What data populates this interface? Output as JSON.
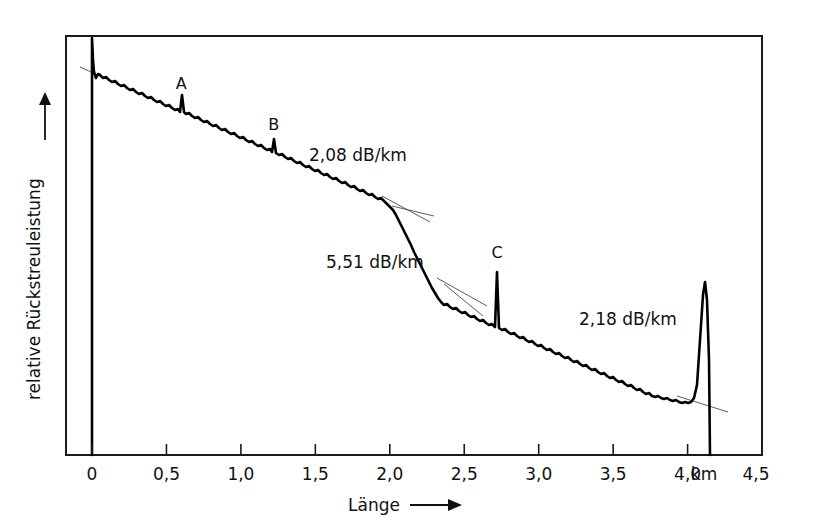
{
  "figure": {
    "kind": "otdr-backscatter-trace",
    "background": "#ffffff",
    "ink_color": "#000000",
    "tangent_color": "#4a4a4a"
  },
  "axes": {
    "x": {
      "label": "Länge",
      "unit_label": "km",
      "arrow": "right-arrow-icon",
      "ticks": [
        "0",
        "0,5",
        "1,0",
        "1,5",
        "2,0",
        "2,5",
        "3,0",
        "3,5",
        "4,0",
        "4,5"
      ],
      "tick_values": [
        0,
        0.5,
        1.0,
        1.5,
        2.0,
        2.5,
        3.0,
        3.5,
        4.0,
        4.5
      ],
      "min": 0,
      "max": 4.5
    },
    "y": {
      "label": "relative Rückstreuleistung",
      "arrow": "up-arrow-icon",
      "ticks": []
    }
  },
  "annotations": {
    "event_labels": [
      {
        "text": "A",
        "x_km": 0.6
      },
      {
        "text": "B",
        "x_km": 1.22
      },
      {
        "text": "C",
        "x_km": 2.72
      }
    ],
    "attenuation_labels": [
      {
        "text": "2,08 dB/km",
        "x_km": 1.48,
        "segment": 1
      },
      {
        "text": "5,51 dB/km",
        "x_km": 1.57,
        "segment": 2
      },
      {
        "text": "2,18 dB/km",
        "x_km": 3.3,
        "segment": 3
      }
    ]
  },
  "chart_data": {
    "type": "line",
    "title": "",
    "xlabel": "Länge",
    "ylabel": "relative Rückstreuleistung",
    "xlim": [
      0,
      4.5
    ],
    "ylim": [
      0,
      1
    ],
    "grid": false,
    "legend": null,
    "xticks": [
      0,
      0.5,
      1.0,
      1.5,
      2.0,
      2.5,
      3.0,
      3.5,
      4.0,
      4.5
    ],
    "xticklabels": [
      "0",
      "0,5",
      "1,0",
      "1,5",
      "2,0",
      "2,5",
      "3,0",
      "3,5",
      "4,0",
      "4,5"
    ],
    "x_unit": "km",
    "yticklabels": [],
    "series": [
      {
        "name": "backscatter",
        "comment": "Pixel polyline in screenshot coordinates; x px = 92 + km*148.9",
        "points_px": [
          [
            92,
            455
          ],
          [
            92,
            150
          ],
          [
            92,
            38
          ],
          [
            93,
            60
          ],
          [
            94,
            72
          ],
          [
            96,
            78
          ],
          [
            98,
            74
          ],
          [
            100,
            75
          ],
          [
            103,
            78
          ],
          [
            106,
            77
          ],
          [
            109,
            80
          ],
          [
            112,
            82
          ],
          [
            115,
            81
          ],
          [
            118,
            84
          ],
          [
            121,
            86
          ],
          [
            124,
            85
          ],
          [
            127,
            88
          ],
          [
            130,
            90
          ],
          [
            133,
            89
          ],
          [
            136,
            92
          ],
          [
            139,
            94
          ],
          [
            142,
            93
          ],
          [
            145,
            96
          ],
          [
            148,
            98
          ],
          [
            151,
            97
          ],
          [
            154,
            100
          ],
          [
            157,
            102
          ],
          [
            160,
            101
          ],
          [
            163,
            104
          ],
          [
            166,
            106
          ],
          [
            169,
            105
          ],
          [
            172,
            108
          ],
          [
            175,
            110
          ],
          [
            178,
            109
          ],
          [
            180,
            112
          ],
          [
            182,
            95
          ],
          [
            184,
            112
          ],
          [
            186,
            114
          ],
          [
            189,
            113
          ],
          [
            192,
            116
          ],
          [
            195,
            118
          ],
          [
            198,
            117
          ],
          [
            201,
            120
          ],
          [
            204,
            122
          ],
          [
            207,
            121
          ],
          [
            210,
            124
          ],
          [
            213,
            126
          ],
          [
            216,
            125
          ],
          [
            219,
            128
          ],
          [
            222,
            130
          ],
          [
            225,
            129
          ],
          [
            228,
            132
          ],
          [
            231,
            134
          ],
          [
            234,
            133
          ],
          [
            237,
            136
          ],
          [
            240,
            138
          ],
          [
            243,
            137
          ],
          [
            246,
            140
          ],
          [
            249,
            142
          ],
          [
            252,
            141
          ],
          [
            255,
            144
          ],
          [
            258,
            146
          ],
          [
            261,
            145
          ],
          [
            264,
            148
          ],
          [
            267,
            150
          ],
          [
            270,
            149
          ],
          [
            272,
            152
          ],
          [
            274,
            139
          ],
          [
            276,
            153
          ],
          [
            279,
            155
          ],
          [
            282,
            154
          ],
          [
            285,
            157
          ],
          [
            288,
            159
          ],
          [
            291,
            158
          ],
          [
            294,
            161
          ],
          [
            297,
            163
          ],
          [
            300,
            162
          ],
          [
            303,
            165
          ],
          [
            306,
            167
          ],
          [
            309,
            166
          ],
          [
            312,
            169
          ],
          [
            315,
            171
          ],
          [
            318,
            170
          ],
          [
            321,
            173
          ],
          [
            324,
            175
          ],
          [
            327,
            174
          ],
          [
            330,
            177
          ],
          [
            333,
            179
          ],
          [
            336,
            178
          ],
          [
            339,
            181
          ],
          [
            342,
            183
          ],
          [
            345,
            182
          ],
          [
            348,
            185
          ],
          [
            351,
            187
          ],
          [
            354,
            186
          ],
          [
            357,
            189
          ],
          [
            360,
            191
          ],
          [
            363,
            190
          ],
          [
            366,
            193
          ],
          [
            369,
            195
          ],
          [
            372,
            194
          ],
          [
            375,
            197
          ],
          [
            378,
            199
          ],
          [
            381,
            198
          ],
          [
            384,
            201
          ],
          [
            387,
            204
          ],
          [
            390,
            207
          ],
          [
            393,
            210
          ],
          [
            396,
            215
          ],
          [
            399,
            221
          ],
          [
            402,
            227
          ],
          [
            405,
            233
          ],
          [
            408,
            239
          ],
          [
            411,
            245
          ],
          [
            414,
            252
          ],
          [
            417,
            258
          ],
          [
            420,
            264
          ],
          [
            423,
            270
          ],
          [
            426,
            276
          ],
          [
            429,
            282
          ],
          [
            432,
            288
          ],
          [
            435,
            293
          ],
          [
            438,
            298
          ],
          [
            441,
            302
          ],
          [
            444,
            305
          ],
          [
            447,
            304
          ],
          [
            450,
            307
          ],
          [
            453,
            309
          ],
          [
            456,
            308
          ],
          [
            459,
            311
          ],
          [
            462,
            313
          ],
          [
            465,
            312
          ],
          [
            468,
            315
          ],
          [
            471,
            317
          ],
          [
            474,
            316
          ],
          [
            477,
            319
          ],
          [
            480,
            321
          ],
          [
            483,
            320
          ],
          [
            486,
            323
          ],
          [
            489,
            325
          ],
          [
            492,
            324
          ],
          [
            495,
            327
          ],
          [
            497,
            272
          ],
          [
            499,
            328
          ],
          [
            502,
            330
          ],
          [
            505,
            329
          ],
          [
            508,
            332
          ],
          [
            511,
            334
          ],
          [
            514,
            333
          ],
          [
            517,
            336
          ],
          [
            520,
            338
          ],
          [
            523,
            337
          ],
          [
            526,
            340
          ],
          [
            529,
            342
          ],
          [
            532,
            341
          ],
          [
            535,
            344
          ],
          [
            538,
            346
          ],
          [
            541,
            345
          ],
          [
            544,
            348
          ],
          [
            547,
            350
          ],
          [
            550,
            349
          ],
          [
            553,
            352
          ],
          [
            556,
            354
          ],
          [
            559,
            353
          ],
          [
            562,
            356
          ],
          [
            565,
            358
          ],
          [
            568,
            357
          ],
          [
            571,
            360
          ],
          [
            574,
            362
          ],
          [
            577,
            361
          ],
          [
            580,
            364
          ],
          [
            583,
            366
          ],
          [
            586,
            365
          ],
          [
            589,
            368
          ],
          [
            592,
            370
          ],
          [
            595,
            369
          ],
          [
            598,
            372
          ],
          [
            601,
            374
          ],
          [
            604,
            373
          ],
          [
            607,
            376
          ],
          [
            610,
            378
          ],
          [
            613,
            377
          ],
          [
            616,
            380
          ],
          [
            619,
            382
          ],
          [
            622,
            381
          ],
          [
            625,
            384
          ],
          [
            628,
            386
          ],
          [
            631,
            385
          ],
          [
            634,
            388
          ],
          [
            637,
            390
          ],
          [
            640,
            389
          ],
          [
            643,
            392
          ],
          [
            646,
            394
          ],
          [
            649,
            393
          ],
          [
            652,
            396
          ],
          [
            655,
            397
          ],
          [
            658,
            396
          ],
          [
            661,
            398
          ],
          [
            664,
            399
          ],
          [
            667,
            398
          ],
          [
            670,
            400
          ],
          [
            673,
            401
          ],
          [
            676,
            400
          ],
          [
            679,
            402
          ],
          [
            682,
            403
          ],
          [
            685,
            402
          ],
          [
            688,
            403
          ],
          [
            691,
            402
          ],
          [
            694,
            398
          ],
          [
            697,
            385
          ],
          [
            700,
            340
          ],
          [
            703,
            295
          ],
          [
            705,
            282
          ],
          [
            707,
            300
          ],
          [
            709,
            360
          ],
          [
            710,
            455
          ]
        ],
        "events": [
          {
            "label": "A",
            "x_km": 0.6
          },
          {
            "label": "B",
            "x_km": 1.22
          },
          {
            "label": "C",
            "x_km": 2.72
          },
          {
            "label": "end-reflection",
            "x_km": 4.12
          }
        ],
        "segments": [
          {
            "attenuation_db_per_km": 2.08,
            "from_km": 0.02,
            "to_km": 2.04
          },
          {
            "attenuation_db_per_km": 5.51,
            "from_km": 2.04,
            "to_km": 2.38
          },
          {
            "attenuation_db_per_km": 2.18,
            "from_km": 2.38,
            "to_km": 4.12
          }
        ]
      }
    ],
    "tangent_lines_px": [
      [
        [
          80,
          67
        ],
        [
          98,
          75
        ]
      ],
      [
        [
          382,
          196
        ],
        [
          430,
          222
        ]
      ],
      [
        [
          392,
          206
        ],
        [
          434,
          216
        ]
      ],
      [
        [
          437,
          278
        ],
        [
          487,
          306
        ]
      ],
      [
        [
          444,
          284
        ],
        [
          483,
          316
        ]
      ],
      [
        [
          677,
          396
        ],
        [
          728,
          412
        ]
      ]
    ]
  }
}
